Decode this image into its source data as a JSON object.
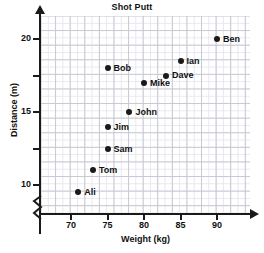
{
  "chart_data": {
    "type": "scatter",
    "title": "Shot Putt",
    "xlabel": "Weight (kg)",
    "ylabel": "Distance (m)",
    "xlim": [
      66.5,
      95
    ],
    "ylim": [
      8.2,
      21
    ],
    "grid": true,
    "y_axis_break": true,
    "legend": "none",
    "xticks": [
      70,
      75,
      80,
      85,
      90
    ],
    "xtick_labels": [
      "70",
      "75",
      "80",
      "85",
      "90"
    ],
    "yticks": [
      10,
      12.5,
      15,
      17.5,
      20
    ],
    "ytick_labels": [
      "10",
      "",
      "15",
      "",
      "20"
    ],
    "points": [
      {
        "label": "Ali",
        "x": 71,
        "y": 9.5,
        "label_dx": 6,
        "label_dy": -5
      },
      {
        "label": "Tom",
        "x": 73,
        "y": 11,
        "label_dx": 6,
        "label_dy": -5
      },
      {
        "label": "Sam",
        "x": 75,
        "y": 12.5,
        "label_dx": 6,
        "label_dy": -5
      },
      {
        "label": "Jim",
        "x": 75,
        "y": 14,
        "label_dx": 6,
        "label_dy": -5
      },
      {
        "label": "John",
        "x": 78,
        "y": 15,
        "label_dx": 6,
        "label_dy": -5
      },
      {
        "label": "Mike",
        "x": 80,
        "y": 17,
        "label_dx": 6,
        "label_dy": -5
      },
      {
        "label": "Dave",
        "x": 83,
        "y": 17.5,
        "label_dx": 6,
        "label_dy": -6
      },
      {
        "label": "Bob",
        "x": 75,
        "y": 18,
        "label_dx": 6,
        "label_dy": -5
      },
      {
        "label": "Ian",
        "x": 85,
        "y": 18.5,
        "label_dx": 6,
        "label_dy": -5
      },
      {
        "label": "Ben",
        "x": 90,
        "y": 20,
        "label_dx": 6,
        "label_dy": -5
      }
    ]
  }
}
